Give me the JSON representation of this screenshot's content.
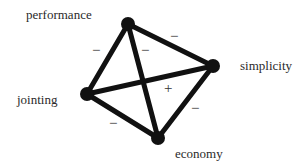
{
  "diagram": {
    "type": "tetrahedron-relationship-graph",
    "nodes": [
      {
        "id": "performance",
        "label": "performance",
        "x": 128,
        "y": 24
      },
      {
        "id": "simplicity",
        "label": "simplicity",
        "x": 213,
        "y": 66
      },
      {
        "id": "jointing",
        "label": "jointing",
        "x": 87,
        "y": 94
      },
      {
        "id": "economy",
        "label": "economy",
        "x": 158,
        "y": 138
      }
    ],
    "edges": [
      {
        "from": "performance",
        "to": "jointing",
        "sign": "−"
      },
      {
        "from": "performance",
        "to": "economy",
        "sign": "−"
      },
      {
        "from": "performance",
        "to": "simplicity",
        "sign": "−"
      },
      {
        "from": "jointing",
        "to": "simplicity",
        "sign": "+"
      },
      {
        "from": "simplicity",
        "to": "economy",
        "sign": "−"
      },
      {
        "from": "jointing",
        "to": "economy",
        "sign": "−"
      }
    ],
    "colors": {
      "line": "#111111",
      "node": "#111111",
      "text": "#2a2a2a"
    }
  }
}
